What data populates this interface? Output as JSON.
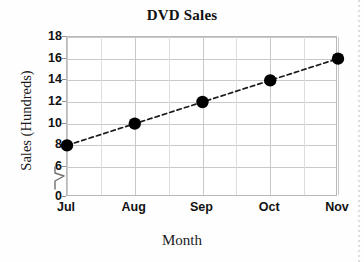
{
  "chart_data": {
    "type": "line",
    "title": "DVD Sales",
    "xlabel": "Month",
    "ylabel": "Sales (Hundreds)",
    "categories": [
      "Jul",
      "Aug",
      "Sep",
      "Oct",
      "Nov"
    ],
    "values": [
      8,
      10,
      12,
      14,
      16
    ],
    "series": [
      {
        "name": "DVD Sales",
        "values": [
          8,
          10,
          12,
          14,
          16
        ]
      }
    ],
    "ylim": [
      0,
      18
    ],
    "yticks": [
      "0",
      "6",
      "8",
      "10",
      "12",
      "14",
      "16",
      "18"
    ],
    "y_axis_break": true,
    "y_axis_break_between": [
      "0",
      "6"
    ],
    "grid": true,
    "legend": "none",
    "marker": "filled-circle",
    "line_style": "dashed",
    "marker_color": "#000000",
    "line_color": "#1a1a1a",
    "grid_color": "#c9c9c9",
    "frame_color": "#b9b9b9",
    "background_color": "#ffffff"
  },
  "axis": {
    "y_ticks": [
      {
        "label": "18",
        "value": 18
      },
      {
        "label": "16",
        "value": 16
      },
      {
        "label": "14",
        "value": 14
      },
      {
        "label": "12",
        "value": 12
      },
      {
        "label": "10",
        "value": 10
      },
      {
        "label": "8",
        "value": 8
      },
      {
        "label": "6",
        "value": 6
      },
      {
        "label": "0",
        "value": 0
      }
    ],
    "x_ticks": [
      {
        "label": "Jul"
      },
      {
        "label": "Aug"
      },
      {
        "label": "Sep"
      },
      {
        "label": "Oct"
      },
      {
        "label": "Nov"
      }
    ]
  },
  "icons": {
    "axis_break": "axis-break-zigzag-icon"
  }
}
